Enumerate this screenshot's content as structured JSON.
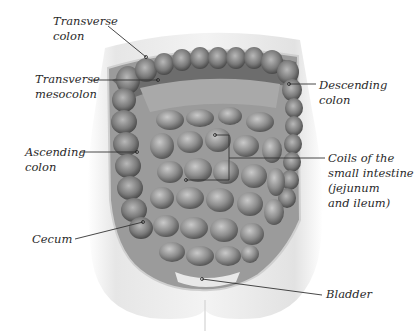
{
  "figure": {
    "labels": [
      {
        "id": "transverse-colon",
        "text": "Transverse\ncolon"
      },
      {
        "id": "transverse-mesocolon",
        "text": "Transverse\nmesocolon"
      },
      {
        "id": "descending-colon",
        "text": "Descending\ncolon"
      },
      {
        "id": "ascending-colon",
        "text": "Ascending\ncolon"
      },
      {
        "id": "small-intestine",
        "text": "Coils of the\nsmall intestine\n(jejunum\nand ileum)"
      },
      {
        "id": "cecum",
        "text": "Cecum"
      },
      {
        "id": "bladder",
        "text": "Bladder"
      }
    ],
    "colors": {
      "background": "#ffffff",
      "body": "#ececec",
      "intestine_dark": "#555555",
      "intestine_mid": "#8a8a8a",
      "intestine_light": "#bdbdbd",
      "leader_line": "#333333"
    }
  }
}
